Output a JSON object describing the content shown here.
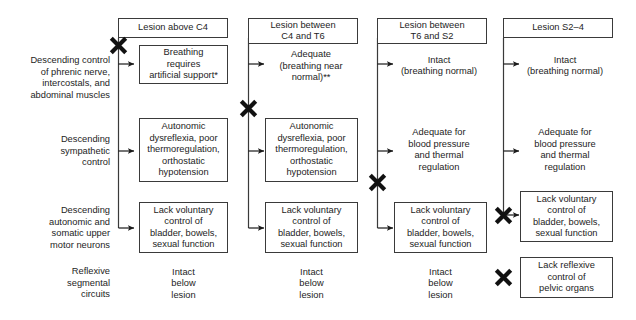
{
  "figure": {
    "type": "diagram"
  },
  "row_labels": [
    {
      "id": "phrenic",
      "text": "Descending control\nof phrenic nerve,\nintercostals, and\nabdominal muscles"
    },
    {
      "id": "sympathetic",
      "text": "Descending\nsympathetic\ncontrol"
    },
    {
      "id": "autonomic-somatic",
      "text": "Descending\nautonomic and\nsomatic upper\nmotor neurons"
    },
    {
      "id": "reflexive",
      "text": "Reflexive\nsegmental\ncircuits"
    }
  ],
  "columns": [
    {
      "id": "above-c4",
      "header": "Lesion above C4",
      "cells": [
        {
          "id": "breathing",
          "text": "Breathing\nrequires\nartificial support*",
          "boxed": true
        },
        {
          "id": "sympathetic",
          "text": "Autonomic\ndysreflexia, poor\nthermoregulation,\northostatic\nhypotension",
          "boxed": true
        },
        {
          "id": "voluntary",
          "text": "Lack voluntary\ncontrol of\nbladder, bowels,\nsexual function",
          "boxed": true
        },
        {
          "id": "reflexive",
          "text": "Intact\nbelow\nlesion",
          "boxed": false
        }
      ]
    },
    {
      "id": "c4-t6",
      "header": "Lesion between\nC4 and T6",
      "cells": [
        {
          "id": "breathing",
          "text": "Adequate\n(breathing near\nnormal)**",
          "boxed": false
        },
        {
          "id": "sympathetic",
          "text": "Autonomic\ndysreflexia, poor\nthermoregulation,\northostatic\nhypotension",
          "boxed": true
        },
        {
          "id": "voluntary",
          "text": "Lack voluntary\ncontrol of\nbladder, bowels,\nsexual function",
          "boxed": true
        },
        {
          "id": "reflexive",
          "text": "Intact\nbelow\nlesion",
          "boxed": false
        }
      ]
    },
    {
      "id": "t6-s2",
      "header": "Lesion between\nT6 and S2",
      "cells": [
        {
          "id": "breathing",
          "text": "Intact\n(breathing normal)",
          "boxed": false
        },
        {
          "id": "sympathetic",
          "text": "Adequate for\nblood pressure\nand thermal\nregulation",
          "boxed": false
        },
        {
          "id": "voluntary",
          "text": "Lack voluntary\ncontrol of\nbladder, bowels,\nsexual function",
          "boxed": true
        },
        {
          "id": "reflexive",
          "text": "Intact\nbelow\nlesion",
          "boxed": false
        }
      ]
    },
    {
      "id": "s2-4",
      "header": "Lesion S2–4",
      "cells": [
        {
          "id": "breathing",
          "text": "Intact\n(breathing normal)",
          "boxed": false
        },
        {
          "id": "sympathetic",
          "text": "Adequate for\nblood pressure\nand thermal\nregulation",
          "boxed": false
        },
        {
          "id": "voluntary",
          "text": "Lack voluntary\ncontrol of\nbladder, bowels,\nsexual function",
          "boxed": true
        },
        {
          "id": "reflexive",
          "text": "Lack reflexive\ncontrol of\npelvic organs",
          "boxed": true
        }
      ]
    }
  ],
  "block_marks": [
    {
      "id": "x-col1-above-breathing",
      "column": "above-c4",
      "above_row": "phrenic"
    },
    {
      "id": "x-col2-above-sympathetic",
      "column": "c4-t6",
      "above_row": "sympathetic"
    },
    {
      "id": "x-col3-above-voluntary",
      "column": "t6-s2",
      "above_row": "autonomic-somatic"
    },
    {
      "id": "x-col4-on-voluntary",
      "column": "s2-4",
      "above_row": "autonomic-somatic"
    },
    {
      "id": "x-col4-on-reflexive",
      "column": "s2-4",
      "above_row": "reflexive"
    }
  ],
  "colors": {
    "stroke": "#3a3a3a",
    "text": "#1d1d1d",
    "background": "#ffffff",
    "mark": "#111111"
  }
}
